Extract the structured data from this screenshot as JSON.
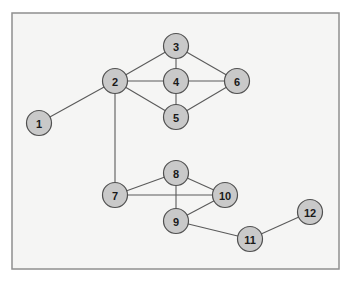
{
  "diagram": {
    "type": "undirected-graph",
    "frame": {
      "x": 12,
      "y": 13,
      "width": 327,
      "height": 256
    },
    "node_radius": 12.5,
    "nodes": [
      {
        "id": "1",
        "label": "1",
        "x": 39,
        "y": 123
      },
      {
        "id": "2",
        "label": "2",
        "x": 115,
        "y": 81
      },
      {
        "id": "3",
        "label": "3",
        "x": 176,
        "y": 46
      },
      {
        "id": "4",
        "label": "4",
        "x": 176,
        "y": 81
      },
      {
        "id": "5",
        "label": "5",
        "x": 176,
        "y": 117
      },
      {
        "id": "6",
        "label": "6",
        "x": 237,
        "y": 81
      },
      {
        "id": "7",
        "label": "7",
        "x": 115,
        "y": 195
      },
      {
        "id": "8",
        "label": "8",
        "x": 176,
        "y": 173
      },
      {
        "id": "9",
        "label": "9",
        "x": 176,
        "y": 221
      },
      {
        "id": "10",
        "label": "10",
        "x": 225,
        "y": 195
      },
      {
        "id": "11",
        "label": "11",
        "x": 250,
        "y": 239
      },
      {
        "id": "12",
        "label": "12",
        "x": 310,
        "y": 212
      }
    ],
    "edges": [
      [
        "1",
        "2"
      ],
      [
        "2",
        "3"
      ],
      [
        "2",
        "4"
      ],
      [
        "2",
        "5"
      ],
      [
        "2",
        "7"
      ],
      [
        "3",
        "4"
      ],
      [
        "3",
        "6"
      ],
      [
        "4",
        "5"
      ],
      [
        "4",
        "6"
      ],
      [
        "5",
        "6"
      ],
      [
        "7",
        "8"
      ],
      [
        "7",
        "10"
      ],
      [
        "8",
        "9"
      ],
      [
        "8",
        "10"
      ],
      [
        "9",
        "10"
      ],
      [
        "9",
        "11"
      ],
      [
        "11",
        "12"
      ]
    ]
  },
  "colors": {
    "frame_fill": "#f5f5f4",
    "frame_stroke": "#8f8f8f",
    "node_fill": "#c9c9c9",
    "node_stroke": "#505050",
    "edge": "#5a5a5a",
    "label": "#1a1a1a"
  }
}
